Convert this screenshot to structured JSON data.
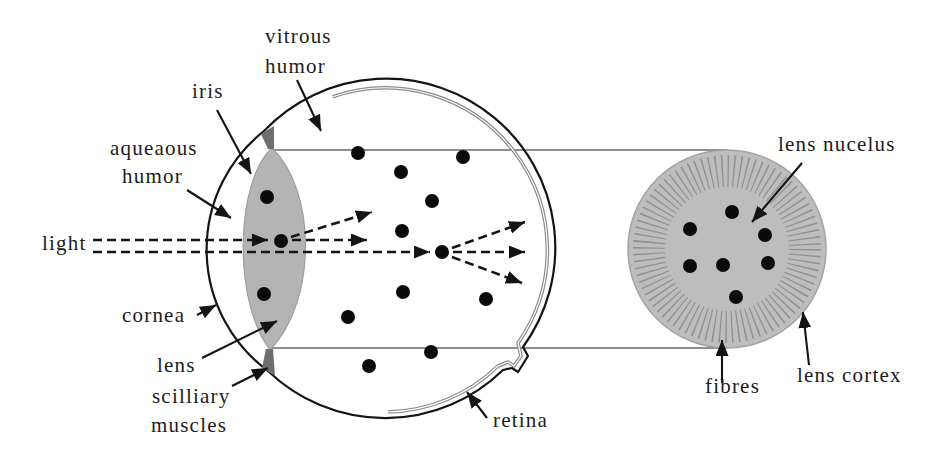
{
  "labels": {
    "vitreous_humor": [
      "vitrous",
      "humor"
    ],
    "iris": "iris",
    "aqueous_humor": [
      "aqueaous",
      "humor"
    ],
    "light": "light",
    "cornea": "cornea",
    "lens": "lens",
    "ciliary_muscles": [
      "scilliary",
      "muscles"
    ],
    "retina": "retina",
    "lens_nucleus": "lens nucelus",
    "fibres": "fibres",
    "lens_cortex": "lens cortex"
  },
  "colors": {
    "outline": "#141414",
    "eye_lens_fill": "#b4b4b4",
    "iris_fill": "#6e6e6e",
    "retina_line": "#8c8c8c",
    "guide_lines": "#8e8e8e",
    "lens_section_fill": "#bdbdbd",
    "fibres": "#8f8f8f",
    "particles": "#0a0a0a",
    "text": "#1c1c1c"
  }
}
